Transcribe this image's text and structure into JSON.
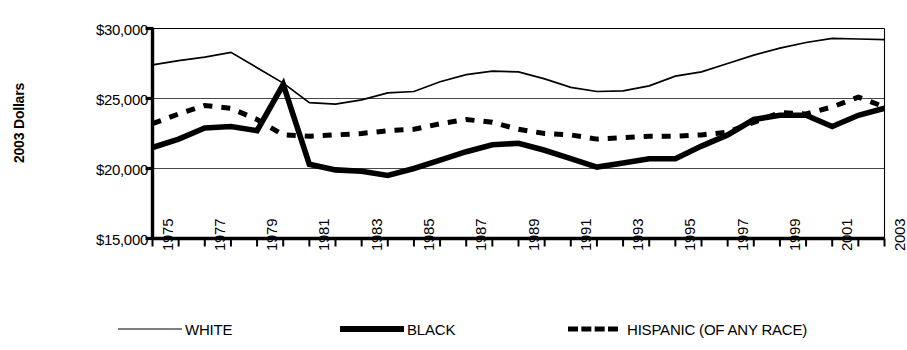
{
  "chart_data": {
    "type": "line",
    "title": "",
    "xlabel": "",
    "ylabel": "2003 Dollars",
    "ylim": [
      15000,
      30000
    ],
    "yticks": [
      30000,
      25000,
      20000,
      15000
    ],
    "ytick_labels": [
      "$30,000",
      "$25,000",
      "$20,000",
      "$15,000"
    ],
    "grid": true,
    "legend_position": "bottom",
    "x": [
      1975,
      1976,
      1977,
      1978,
      1979,
      1980,
      1981,
      1982,
      1983,
      1984,
      1985,
      1986,
      1987,
      1988,
      1989,
      1990,
      1991,
      1992,
      1993,
      1994,
      1995,
      1996,
      1997,
      1998,
      1999,
      2000,
      2001,
      2002,
      2003
    ],
    "xtick_labels": [
      "1975",
      "1977",
      "1979",
      "1981",
      "1983",
      "1985",
      "1987",
      "1989",
      "1991",
      "1993",
      "1995",
      "1997",
      "1999",
      "2001",
      "2003"
    ],
    "xtick_years": [
      1975,
      1977,
      1979,
      1981,
      1983,
      1985,
      1987,
      1989,
      1991,
      1993,
      1995,
      1997,
      1999,
      2001,
      2003
    ],
    "xlim": [
      1975,
      2003
    ],
    "series": [
      {
        "name": "WHITE",
        "style": "thin-solid",
        "color": "#000000",
        "values": [
          27400,
          27700,
          27950,
          28300,
          27200,
          26100,
          24700,
          24600,
          24900,
          25400,
          25500,
          26200,
          26700,
          26950,
          26900,
          26400,
          25800,
          25500,
          25550,
          25900,
          26600,
          26900,
          27500,
          28100,
          28600,
          29000,
          29300,
          29250,
          29200
        ]
      },
      {
        "name": "BLACK",
        "style": "thick-solid",
        "color": "#000000",
        "values": [
          21500,
          22100,
          22900,
          23000,
          22700,
          26000,
          20300,
          19900,
          19800,
          19500,
          20000,
          20600,
          21200,
          21700,
          21800,
          21300,
          20700,
          20100,
          20400,
          20700,
          20700,
          21600,
          22400,
          23500,
          23800,
          23800,
          23000,
          23800,
          24300
        ]
      },
      {
        "name": "HISPANIC (OF ANY RACE)",
        "style": "dashed",
        "color": "#000000",
        "values": [
          23200,
          23900,
          24500,
          24300,
          23500,
          22400,
          22300,
          22400,
          22500,
          22700,
          22800,
          23200,
          23500,
          23300,
          22800,
          22500,
          22400,
          22100,
          22200,
          22300,
          22300,
          22400,
          22600,
          23300,
          24000,
          23900,
          24400,
          25100,
          24400
        ]
      }
    ],
    "legend": [
      {
        "label": "WHITE",
        "style": "thin-solid"
      },
      {
        "label": "BLACK",
        "style": "thick-solid"
      },
      {
        "label": "HISPANIC (OF ANY RACE)",
        "style": "dashed"
      }
    ]
  }
}
